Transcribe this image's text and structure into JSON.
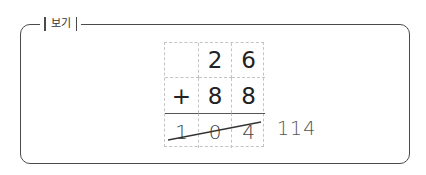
{
  "box": {
    "title": "보기"
  },
  "problem": {
    "rows": [
      [
        "",
        "2",
        "6"
      ],
      [
        "+",
        "8",
        "8"
      ],
      [
        "1",
        "0",
        "4"
      ]
    ],
    "operator": "+",
    "addend1": "26",
    "addend2": "88",
    "wrong_answer": "104",
    "wrong_answer_struck": true
  },
  "correction": {
    "answer": "114"
  },
  "colors": {
    "frame": "#4a4a4a",
    "grid_dash": "#c4c4c4",
    "text": "#222222"
  }
}
